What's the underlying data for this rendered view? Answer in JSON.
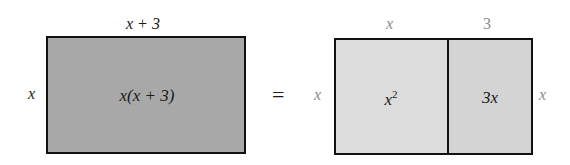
{
  "left_rect": {
    "top_label": "x + 3",
    "side_label": "x",
    "area_label": "x(x + 3)",
    "fill": "#a8a8a8"
  },
  "equals": "=",
  "right_rect": {
    "top_labels": [
      "x",
      "3"
    ],
    "left_label": "x",
    "right_label": "x",
    "cells": [
      {
        "area_base": "x",
        "area_exp": "2",
        "fill": "#dcdcdc"
      },
      {
        "area_label": "3x",
        "fill": "#d4d4d4"
      }
    ]
  }
}
